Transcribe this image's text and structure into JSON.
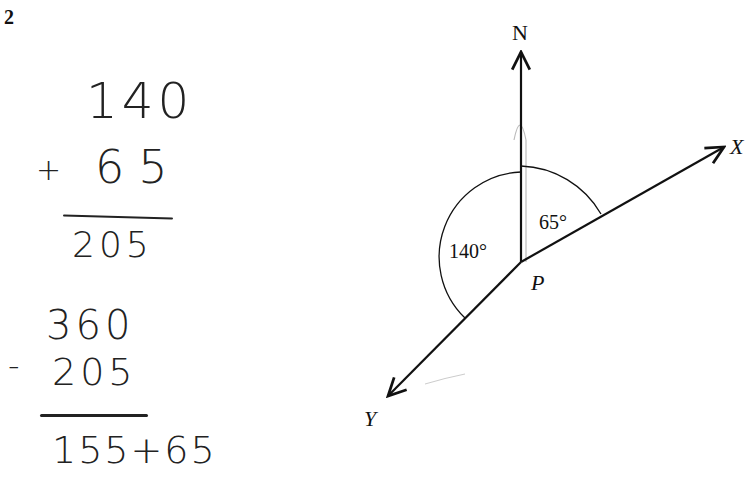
{
  "question": {
    "number": "2"
  },
  "working": {
    "addition": {
      "top": "140",
      "operator": "+",
      "bottom": "65",
      "result": "205"
    },
    "subtraction": {
      "top": "360",
      "operator": "-",
      "bottom": "205",
      "result": "155+65"
    }
  },
  "diagram": {
    "north_label": "N",
    "x_label": "X",
    "y_label": "Y",
    "point_label": "P",
    "angle_left": "140°",
    "angle_right": "65°"
  }
}
